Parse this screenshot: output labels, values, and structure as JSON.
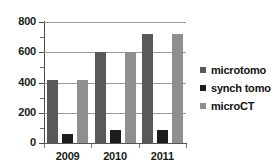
{
  "chart_data": {
    "type": "bar",
    "title": "",
    "subtitle": "",
    "xlabel": "",
    "ylabel": "",
    "categories": [
      "2009",
      "2010",
      "2011"
    ],
    "series": [
      {
        "name": "microtomo",
        "color": "#595959",
        "values": [
          415,
          600,
          720
        ]
      },
      {
        "name": "synch tomo",
        "color": "#1c1c1c",
        "values": [
          60,
          85,
          85
        ]
      },
      {
        "name": "microCT",
        "color": "#8f8f8f",
        "values": [
          415,
          600,
          720
        ]
      }
    ],
    "ylim": [
      0,
      800
    ],
    "ytick_labels": [
      "0",
      "200",
      "400",
      "600",
      "800"
    ],
    "ytick_values": [
      0,
      200,
      400,
      600,
      800
    ],
    "y_minor_step": 100,
    "grid": true,
    "legend_position": "right"
  },
  "legend": {
    "items": [
      {
        "label": "microtomo",
        "swatch": "#595959"
      },
      {
        "label": "synch tomo",
        "swatch": "#1c1c1c"
      },
      {
        "label": "microCT",
        "swatch": "#8f8f8f"
      }
    ]
  }
}
